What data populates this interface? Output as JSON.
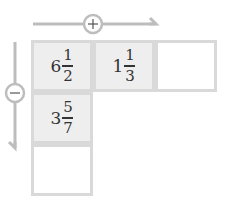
{
  "arrows": {
    "horizontal": {
      "sign": "+",
      "direction": "right",
      "color": "#bdbdbd"
    },
    "vertical": {
      "sign": "−",
      "direction": "down",
      "color": "#bdbdbd"
    }
  },
  "grid": {
    "border_color": "#d9d9d9",
    "filled_color": "#eeeeee",
    "cells": [
      {
        "row": 0,
        "col": 0,
        "whole": "6",
        "numerator": "1",
        "denominator": "2",
        "filled": true
      },
      {
        "row": 0,
        "col": 1,
        "whole": "1",
        "numerator": "1",
        "denominator": "3",
        "filled": true
      },
      {
        "row": 0,
        "col": 2,
        "whole": "",
        "numerator": "",
        "denominator": "",
        "filled": false
      },
      {
        "row": 1,
        "col": 0,
        "whole": "3",
        "numerator": "5",
        "denominator": "7",
        "filled": true
      },
      {
        "row": 2,
        "col": 0,
        "whole": "",
        "numerator": "",
        "denominator": "",
        "filled": false
      }
    ]
  }
}
